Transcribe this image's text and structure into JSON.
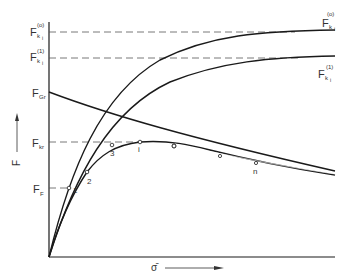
{
  "diagram": {
    "y_axis_label": "F",
    "x_axis_label": "σ̄",
    "y_levels": [
      {
        "id": "Fk0",
        "main": "F",
        "sub": "k",
        "subsub": "i",
        "sup": "(o)"
      },
      {
        "id": "Fk1",
        "main": "F",
        "sub": "k",
        "subsub": "i",
        "sup": "(1)"
      },
      {
        "id": "FGr",
        "main": "F",
        "sub": "Gr"
      },
      {
        "id": "Fkr",
        "main": "F",
        "sub": "kr"
      },
      {
        "id": "FF",
        "main": "F",
        "sub": "F"
      }
    ],
    "curve_labels": {
      "upper_main": "F",
      "upper_sub": "k",
      "upper_subsub": "i",
      "upper_sup": "(o)",
      "lower_main": "F",
      "lower_sub": "k",
      "lower_subsub": "i",
      "lower_sup": "(1)"
    },
    "point_labels": [
      "1",
      "2",
      "3",
      "i",
      "n"
    ],
    "colors": {
      "line": "#1a1a1a",
      "dash": "#555555",
      "background": "#ffffff"
    }
  }
}
